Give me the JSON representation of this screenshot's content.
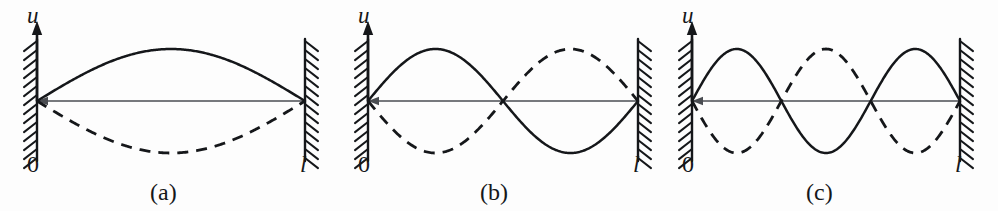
{
  "figure": {
    "background_color": "#fdfdfd",
    "ink_color": "#15171a",
    "axis_color": "#4a4d52",
    "width": 998,
    "height": 211
  },
  "axis": {
    "vertical_label": "u",
    "origin_label": "0",
    "length_label": "l"
  },
  "panels": [
    {
      "caption": "(a)",
      "mode": 1,
      "x_left": 37,
      "x_right": 305,
      "baseline_y": 101,
      "amplitude": 52,
      "caption_x": 150,
      "u_label_x": 27,
      "u_label_y": 4,
      "zero_label_x": 27,
      "l_label_x": 300
    },
    {
      "caption": "(b)",
      "mode": 2,
      "x_left": 368,
      "x_right": 638,
      "baseline_y": 101,
      "amplitude": 52,
      "caption_x": 480,
      "u_label_x": 358,
      "u_label_y": 4,
      "zero_label_x": 358,
      "l_label_x": 633
    },
    {
      "caption": "(c)",
      "mode": 3,
      "x_left": 692,
      "x_right": 960,
      "baseline_y": 101,
      "amplitude": 52,
      "caption_x": 806,
      "u_label_x": 682,
      "u_label_y": 4,
      "zero_label_x": 682,
      "l_label_x": 955
    }
  ],
  "chart_data": {
    "type": "line",
    "xlabel": "x",
    "ylabel": "u",
    "xlim": [
      0,
      1
    ],
    "ylim": [
      -1,
      1
    ],
    "grid": false,
    "legend": "none",
    "x_tick_labels": [
      "0",
      "l"
    ],
    "annotations": [
      "(a)",
      "(b)",
      "(c)"
    ],
    "subplots": [
      {
        "caption": "(a)",
        "mode_number": 1,
        "nodes": [
          "0",
          "l"
        ],
        "antinodes": 1,
        "series": [
          {
            "name": "solid",
            "formula": "u = A sin(pi x / l)",
            "style": "solid",
            "sign": "+1"
          },
          {
            "name": "dashed",
            "formula": "u = -A sin(pi x / l)",
            "style": "dashed",
            "sign": "-1"
          }
        ]
      },
      {
        "caption": "(b)",
        "mode_number": 2,
        "nodes": [
          "0",
          "l/2",
          "l"
        ],
        "antinodes": 2,
        "series": [
          {
            "name": "solid",
            "formula": "u = A sin(2 pi x / l)",
            "style": "solid",
            "sign": "+1"
          },
          {
            "name": "dashed",
            "formula": "u = -A sin(2 pi x / l)",
            "style": "dashed",
            "sign": "-1"
          }
        ]
      },
      {
        "caption": "(c)",
        "mode_number": 3,
        "nodes": [
          "0",
          "l/3",
          "2l/3",
          "l"
        ],
        "antinodes": 3,
        "series": [
          {
            "name": "solid",
            "formula": "u = A sin(3 pi x / l)",
            "style": "solid",
            "sign": "+1"
          },
          {
            "name": "dashed",
            "formula": "u = -A sin(3 pi x / l)",
            "style": "dashed",
            "sign": "-1"
          }
        ]
      }
    ]
  }
}
